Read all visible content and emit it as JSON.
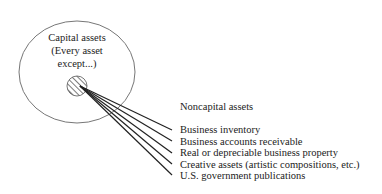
{
  "diagram": {
    "outer_circle": {
      "label_lines": [
        "Capital assets",
        "(Every asset",
        "except...)"
      ]
    },
    "noncapital": {
      "heading": "Noncapital assets",
      "items": [
        "Business inventory",
        "Business accounts receivable",
        "Real or depreciable business property",
        "Creative assets (artistic compositions, etc.)",
        "U.S. government publications"
      ]
    },
    "colors": {
      "circle_stroke": "#777777",
      "line_stroke": "#222222",
      "text": "#222222"
    }
  }
}
